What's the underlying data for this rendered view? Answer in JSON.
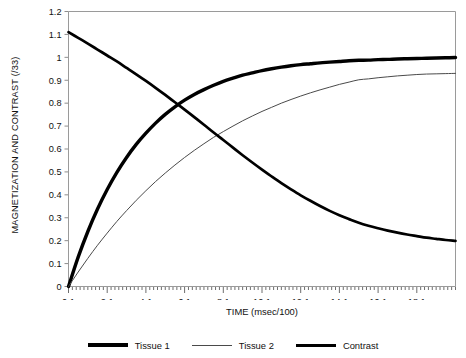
{
  "chart_data": {
    "type": "line",
    "title": "",
    "xlabel": "TIME (msec/100)",
    "ylabel": "MAGNETIZATION AND CONTRAST (/33)",
    "xlim": [
      0.1,
      20.1
    ],
    "ylim": [
      0,
      1.2
    ],
    "grid": false,
    "legend_position": "bottom",
    "x_tick_labels": [
      "0.1",
      "2.1",
      "4.1",
      "6.1",
      "8.1",
      "10.1",
      "12.1",
      "14.1",
      "16.1",
      "18.1"
    ],
    "x_tick_values": [
      0.1,
      2.1,
      4.1,
      6.1,
      8.1,
      10.1,
      12.1,
      14.1,
      16.1,
      18.1
    ],
    "x_minor_tick_step": 0.2,
    "y_tick_labels": [
      "0",
      "0.1",
      "0.2",
      "0.3",
      "0.4",
      "0.5",
      "0.6",
      "0.7",
      "0.8",
      "0.9",
      "1",
      "1.1",
      "1.2"
    ],
    "y_tick_values": [
      0,
      0.1,
      0.2,
      0.3,
      0.4,
      0.5,
      0.6,
      0.7,
      0.8,
      0.9,
      1.0,
      1.1,
      1.2
    ],
    "x": [
      0.1,
      0.6,
      1.1,
      1.6,
      2.1,
      2.6,
      3.1,
      3.6,
      4.1,
      4.6,
      5.1,
      5.6,
      6.1,
      6.6,
      7.1,
      7.6,
      8.1,
      8.6,
      9.1,
      9.6,
      10.1,
      10.6,
      11.1,
      11.6,
      12.1,
      12.6,
      13.1,
      13.6,
      14.1,
      14.6,
      15.1,
      15.6,
      16.1,
      16.6,
      17.1,
      17.6,
      18.1,
      18.6,
      19.1,
      19.6,
      20.1
    ],
    "series": [
      {
        "name": "Tissue 1",
        "color": "#000000",
        "line_width": 3.4,
        "values": [
          0.0,
          0.128,
          0.24,
          0.338,
          0.423,
          0.498,
          0.563,
          0.62,
          0.669,
          0.713,
          0.751,
          0.784,
          0.813,
          0.838,
          0.859,
          0.878,
          0.895,
          0.909,
          0.922,
          0.932,
          0.942,
          0.95,
          0.957,
          0.963,
          0.968,
          0.972,
          0.976,
          0.979,
          0.982,
          0.985,
          0.987,
          0.988,
          0.99,
          0.991,
          0.993,
          0.994,
          0.995,
          0.996,
          0.997,
          0.998,
          0.999
        ]
      },
      {
        "name": "Tissue 2",
        "color": "#4a4a4a",
        "line_width": 1.0,
        "values": [
          0.0,
          0.063,
          0.123,
          0.18,
          0.233,
          0.284,
          0.331,
          0.376,
          0.418,
          0.458,
          0.495,
          0.53,
          0.563,
          0.594,
          0.623,
          0.651,
          0.676,
          0.7,
          0.723,
          0.744,
          0.764,
          0.782,
          0.8,
          0.816,
          0.831,
          0.845,
          0.858,
          0.87,
          0.882,
          0.892,
          0.902,
          0.906,
          0.911,
          0.915,
          0.919,
          0.922,
          0.925,
          0.927,
          0.928,
          0.929,
          0.93
        ]
      },
      {
        "name": "Contrast",
        "color": "#000000",
        "line_width": 2.7,
        "values": [
          1.11,
          1.085,
          1.06,
          1.034,
          1.008,
          0.982,
          0.954,
          0.926,
          0.897,
          0.867,
          0.836,
          0.804,
          0.772,
          0.739,
          0.706,
          0.672,
          0.639,
          0.606,
          0.573,
          0.541,
          0.51,
          0.48,
          0.451,
          0.424,
          0.398,
          0.374,
          0.351,
          0.33,
          0.311,
          0.294,
          0.278,
          0.265,
          0.254,
          0.244,
          0.235,
          0.227,
          0.22,
          0.213,
          0.208,
          0.203,
          0.199
        ]
      }
    ]
  },
  "legend": {
    "items": [
      {
        "label": "Tissue 1"
      },
      {
        "label": "Tissue 2"
      },
      {
        "label": "Contrast"
      }
    ]
  }
}
